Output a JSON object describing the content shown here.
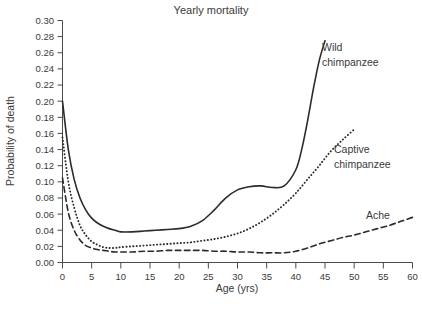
{
  "chart_data": {
    "type": "line",
    "title": "Yearly mortality",
    "xlabel": "Age (yrs)",
    "ylabel": "Probability of death",
    "xlim": [
      0,
      60
    ],
    "ylim": [
      0.0,
      0.3
    ],
    "grid": false,
    "legend_position": "inline-labels",
    "xticks": [
      "0",
      "5",
      "10",
      "15",
      "20",
      "25",
      "30",
      "35",
      "40",
      "45",
      "50",
      "55",
      "60"
    ],
    "xtick_values": [
      0,
      5,
      10,
      15,
      20,
      25,
      30,
      35,
      40,
      45,
      50,
      55,
      60
    ],
    "yticks": [
      "0.00",
      "0.02",
      "0.04",
      "0.06",
      "0.08",
      "0.10",
      "0.12",
      "0.14",
      "0.16",
      "0.18",
      "0.20",
      "0.22",
      "0.24",
      "0.26",
      "0.28",
      "0.30"
    ],
    "ytick_values": [
      0.0,
      0.02,
      0.04,
      0.06,
      0.08,
      0.1,
      0.12,
      0.14,
      0.16,
      0.18,
      0.2,
      0.22,
      0.24,
      0.26,
      0.28,
      0.3
    ],
    "series": [
      {
        "name": "Wild chimpanzee",
        "style": "solid",
        "color": "#2b2b2b",
        "label_line1": "Wild",
        "label_line2": "chimpanzee",
        "x": [
          0,
          1,
          2,
          3,
          4,
          5,
          6,
          7,
          8,
          9,
          10,
          12,
          14,
          16,
          18,
          20,
          22,
          24,
          26,
          28,
          30,
          32,
          34,
          36,
          38,
          40,
          41,
          42,
          43,
          44,
          45
        ],
        "values": [
          0.2,
          0.14,
          0.103,
          0.08,
          0.065,
          0.055,
          0.049,
          0.045,
          0.042,
          0.04,
          0.038,
          0.038,
          0.039,
          0.04,
          0.041,
          0.042,
          0.045,
          0.052,
          0.065,
          0.08,
          0.09,
          0.094,
          0.095,
          0.093,
          0.095,
          0.115,
          0.14,
          0.175,
          0.215,
          0.25,
          0.275
        ]
      },
      {
        "name": "Captive chimpanzee",
        "style": "dotted",
        "color": "#2b2b2b",
        "label_line1": "Captive",
        "label_line2": "chimpanzee",
        "x": [
          0,
          1,
          2,
          3,
          4,
          5,
          6,
          7,
          8,
          9,
          10,
          12,
          14,
          16,
          18,
          20,
          22,
          24,
          26,
          28,
          30,
          32,
          34,
          36,
          38,
          40,
          42,
          44,
          46,
          48,
          50
        ],
        "values": [
          0.155,
          0.1,
          0.068,
          0.046,
          0.034,
          0.026,
          0.022,
          0.019,
          0.018,
          0.018,
          0.019,
          0.02,
          0.021,
          0.022,
          0.023,
          0.024,
          0.025,
          0.027,
          0.029,
          0.032,
          0.036,
          0.042,
          0.05,
          0.06,
          0.072,
          0.086,
          0.103,
          0.12,
          0.138,
          0.152,
          0.165
        ]
      },
      {
        "name": "Ache",
        "style": "dashed",
        "color": "#2b2b2b",
        "label_line1": "Ache",
        "label_line2": "",
        "x": [
          0,
          1,
          2,
          3,
          4,
          5,
          6,
          7,
          8,
          9,
          10,
          12,
          14,
          16,
          18,
          20,
          22,
          24,
          26,
          28,
          30,
          32,
          34,
          36,
          38,
          40,
          42,
          44,
          46,
          48,
          50,
          52,
          54,
          56,
          58,
          60
        ],
        "values": [
          0.105,
          0.062,
          0.04,
          0.028,
          0.021,
          0.018,
          0.016,
          0.015,
          0.014,
          0.013,
          0.013,
          0.013,
          0.014,
          0.014,
          0.015,
          0.015,
          0.015,
          0.015,
          0.014,
          0.014,
          0.013,
          0.013,
          0.012,
          0.012,
          0.012,
          0.014,
          0.018,
          0.023,
          0.027,
          0.031,
          0.034,
          0.038,
          0.042,
          0.046,
          0.051,
          0.056
        ]
      }
    ]
  }
}
